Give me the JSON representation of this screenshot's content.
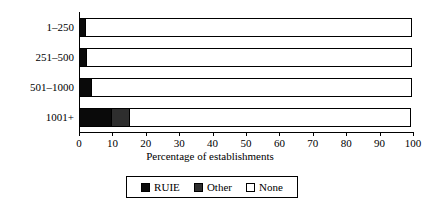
{
  "chart_data": {
    "type": "bar",
    "orientation": "horizontal",
    "stacked": true,
    "title": "",
    "xlabel": "Percentage of establishments",
    "ylabel": "",
    "xlim": [
      0,
      100
    ],
    "xticks": [
      0,
      10,
      20,
      30,
      40,
      50,
      60,
      70,
      80,
      90,
      100
    ],
    "grid": false,
    "legend_position": "bottom",
    "categories": [
      "1–250",
      "251–500",
      "501–1000",
      "1001+"
    ],
    "series": [
      {
        "name": "RUIE",
        "color": "#0a0a0a",
        "values": [
          2.0,
          2.5,
          4.0,
          10.0
        ]
      },
      {
        "name": "Other",
        "color": "#2e2e2e",
        "values": [
          0.0,
          0.0,
          0.0,
          5.5
        ]
      },
      {
        "name": "None",
        "color": "#ffffff",
        "values": [
          98.0,
          97.5,
          96.0,
          84.5
        ]
      }
    ]
  },
  "axis": {
    "tick_labels": [
      "0",
      "10",
      "20",
      "30",
      "40",
      "50",
      "60",
      "70",
      "80",
      "90",
      "100"
    ],
    "x_axis_title": "Percentage of establishments"
  },
  "legend": {
    "items": [
      {
        "label": "RUIE",
        "swatch": "ruie-swatch"
      },
      {
        "label": "Other",
        "swatch": "other-swatch"
      },
      {
        "label": "None",
        "swatch": "none-swatch"
      }
    ]
  }
}
